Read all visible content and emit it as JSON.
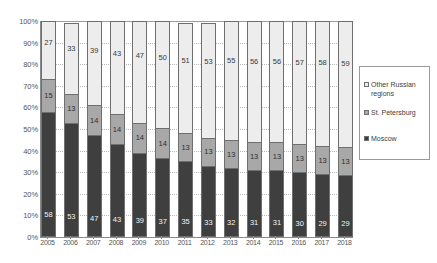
{
  "chart_data": {
    "type": "bar",
    "subtype": "100% stacked column",
    "title": "",
    "subtitle": "",
    "xlabel": "",
    "ylabel": "",
    "ylim": [
      0,
      100
    ],
    "ytick_labels": [
      "100%",
      "90%",
      "80%",
      "70%",
      "60%",
      "50%",
      "40%",
      "30%",
      "20%",
      "10%",
      "0%"
    ],
    "ytick_values": [
      100,
      90,
      80,
      70,
      60,
      50,
      40,
      30,
      20,
      10,
      0
    ],
    "grid": true,
    "legend_position": "right",
    "categories": [
      "2005",
      "2006",
      "2007",
      "2008",
      "2009",
      "2010",
      "2011",
      "2012",
      "2013",
      "2014",
      "2015",
      "2016",
      "2017",
      "2018"
    ],
    "series": [
      {
        "name": "Other Russian regions",
        "color": "#ededed",
        "values": [
          27,
          33,
          39,
          43,
          47,
          50,
          51,
          53,
          55,
          56,
          56,
          57,
          58,
          59
        ]
      },
      {
        "name": "St. Petersburg",
        "color": "#a8a8a8",
        "values": [
          15,
          13,
          14,
          14,
          14,
          14,
          13,
          13,
          13,
          13,
          13,
          13,
          13,
          13
        ]
      },
      {
        "name": "Moscow",
        "color": "#3f3f3f",
        "values": [
          58,
          53,
          47,
          43,
          39,
          37,
          35,
          33,
          32,
          31,
          31,
          30,
          29,
          29
        ]
      }
    ]
  },
  "legend": {
    "entries": [
      {
        "label": "Other Russian regions",
        "icon": "legend-swatch-other-russian-regions"
      },
      {
        "label": "St. Petersburg",
        "icon": "legend-swatch-st-petersburg"
      },
      {
        "label": "Moscow",
        "icon": "legend-swatch-moscow"
      }
    ]
  }
}
